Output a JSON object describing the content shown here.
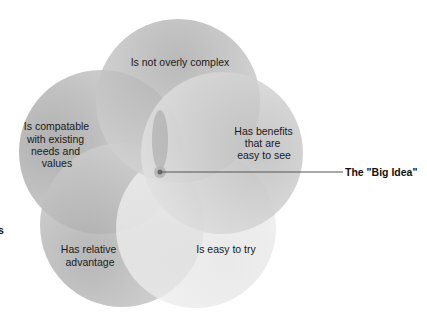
{
  "diagram": {
    "type": "five-circle venn / flower",
    "circles": [
      {
        "id": "top",
        "lines": [
          "Is not overly complex"
        ],
        "fill": "#b3b3b3"
      },
      {
        "id": "left",
        "lines": [
          "Is compatable",
          "with existing",
          "needs and",
          "values"
        ],
        "fill": "#a9a9a9"
      },
      {
        "id": "right",
        "lines": [
          "Has benefits",
          "that are",
          "easy to see"
        ],
        "fill": "#c4c4c4"
      },
      {
        "id": "bottom-left",
        "lines": [
          "Has relative",
          "advantage"
        ],
        "fill": "#a6a6a6"
      },
      {
        "id": "bottom-right",
        "lines": [
          "Is easy to try"
        ],
        "fill": "#dedede"
      }
    ],
    "center_callout": {
      "label": "The \"Big Idea\"",
      "line_color": "#555555"
    },
    "edge_fragment": "s"
  }
}
